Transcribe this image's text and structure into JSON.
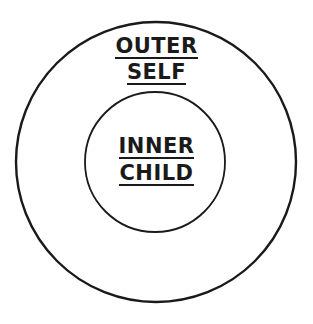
{
  "diagram": {
    "type": "concentric-circles",
    "stroke_color": "#1a1a1a",
    "background": "#ffffff",
    "outer": {
      "label_lines": [
        "OUTER",
        "SELF"
      ]
    },
    "inner": {
      "label_lines": [
        "INNER",
        "CHILD"
      ]
    }
  }
}
